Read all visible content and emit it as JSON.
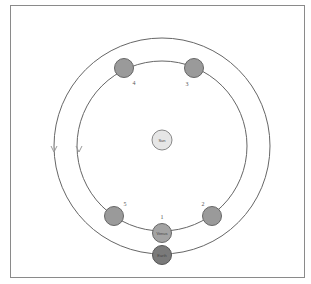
{
  "diagram": {
    "title": "",
    "sun": {
      "label": "Sun",
      "fill": "#e6e6e6"
    },
    "earth": {
      "label": "Earth",
      "fill": "#7a7a7a"
    },
    "venus": {
      "label": "Venus",
      "fill": "#a3a3a3"
    },
    "positions": [
      {
        "label": "1"
      },
      {
        "label": "2"
      },
      {
        "label": "3"
      },
      {
        "label": "4"
      },
      {
        "label": "5"
      }
    ],
    "orbits": [
      {
        "name": "Venus orbit"
      },
      {
        "name": "Earth orbit"
      }
    ],
    "colors": {
      "frame": "#8a8a8a",
      "orbit": "#666666",
      "planet": "#9a9a9a",
      "planet_stroke": "#666666"
    }
  }
}
